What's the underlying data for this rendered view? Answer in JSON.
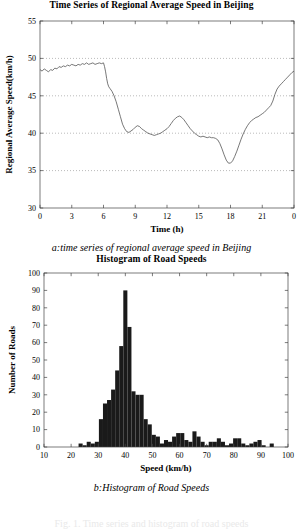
{
  "figure": {
    "panel_a": {
      "title": "Time Series of Regional Average Speed in Beijing",
      "caption": "a:time series of regional average speed in Beijing"
    },
    "panel_b": {
      "title": "Histogram of Road Speeds",
      "caption": "b:Histogram of Road Speeds"
    },
    "footer_partial": "Fig. 1.  Time series and histogram of road speeds"
  },
  "chart_data": [
    {
      "type": "line",
      "title": "Time Series of Regional Average Speed in Beijing",
      "xlabel": "Time (h)",
      "ylabel": "Regional Average Speed(km/h)",
      "xlim": [
        0,
        24
      ],
      "ylim": [
        30,
        55
      ],
      "xticks": [
        0,
        3,
        6,
        9,
        12,
        15,
        18,
        21,
        24
      ],
      "xticklabels": [
        "0",
        "3",
        "6",
        "9",
        "12",
        "15",
        "18",
        "21",
        "0"
      ],
      "yticks": [
        30,
        35,
        40,
        45,
        50,
        55
      ],
      "yticklabels": [
        "30",
        "35",
        "40",
        "45",
        "50",
        "55"
      ],
      "grid": "horizontal-dotted",
      "line_color": "#555555",
      "series": [
        {
          "name": "Regional Average Speed",
          "x": [
            0,
            0.2,
            0.4,
            0.6,
            0.8,
            1.0,
            1.2,
            1.4,
            1.6,
            1.8,
            2.0,
            2.2,
            2.4,
            2.6,
            2.8,
            3.0,
            3.2,
            3.4,
            3.6,
            3.8,
            4.0,
            4.2,
            4.4,
            4.6,
            4.8,
            5.0,
            5.2,
            5.4,
            5.6,
            5.8,
            6.0,
            6.1,
            6.2,
            6.3,
            6.4,
            6.5,
            6.6,
            6.8,
            7.0,
            7.2,
            7.4,
            7.6,
            7.8,
            8.0,
            8.2,
            8.4,
            8.6,
            8.8,
            9.0,
            9.2,
            9.4,
            9.6,
            9.8,
            10.0,
            10.2,
            10.4,
            10.6,
            10.8,
            11.0,
            11.2,
            11.4,
            11.6,
            11.8,
            12.0,
            12.2,
            12.4,
            12.6,
            12.8,
            13.0,
            13.2,
            13.4,
            13.6,
            13.8,
            14.0,
            14.2,
            14.4,
            14.6,
            14.8,
            15.0,
            15.2,
            15.4,
            15.6,
            15.8,
            16.0,
            16.2,
            16.4,
            16.6,
            16.8,
            17.0,
            17.2,
            17.4,
            17.6,
            17.8,
            18.0,
            18.2,
            18.4,
            18.6,
            18.8,
            19.0,
            19.2,
            19.4,
            19.6,
            19.8,
            20.0,
            20.2,
            20.4,
            20.6,
            20.8,
            21.0,
            21.2,
            21.4,
            21.6,
            21.8,
            22.0,
            22.2,
            22.4,
            22.6,
            22.8,
            23.0,
            23.2,
            23.4,
            23.6,
            23.8,
            24.0
          ],
          "y": [
            48.5,
            48.3,
            48.6,
            48.4,
            48.2,
            48.5,
            48.4,
            48.7,
            48.6,
            48.9,
            48.8,
            49.0,
            48.9,
            49.1,
            49.0,
            49.2,
            49.1,
            49.0,
            49.2,
            49.1,
            49.3,
            49.2,
            49.4,
            49.2,
            49.3,
            49.4,
            49.2,
            49.3,
            49.4,
            49.3,
            49.4,
            48.9,
            48.2,
            47.3,
            46.6,
            46.2,
            46.0,
            45.6,
            45.0,
            44.2,
            43.2,
            42.2,
            41.2,
            40.6,
            40.2,
            40.1,
            40.3,
            40.5,
            40.8,
            41.0,
            40.9,
            40.6,
            40.4,
            40.2,
            40.0,
            39.9,
            39.8,
            39.7,
            39.8,
            39.9,
            40.0,
            40.2,
            40.4,
            40.6,
            40.9,
            41.3,
            41.7,
            42.0,
            42.2,
            42.3,
            42.1,
            41.8,
            41.4,
            41.0,
            40.6,
            40.3,
            40.0,
            39.8,
            39.6,
            39.5,
            39.6,
            39.5,
            39.4,
            39.5,
            39.4,
            39.4,
            39.3,
            39.1,
            38.6,
            37.9,
            37.1,
            36.4,
            36.0,
            36.0,
            36.3,
            36.9,
            37.6,
            38.4,
            39.2,
            39.9,
            40.5,
            41.0,
            41.4,
            41.7,
            41.9,
            42.1,
            42.2,
            42.4,
            42.6,
            42.8,
            43.1,
            43.4,
            43.7,
            44.3,
            45.2,
            45.9,
            46.3,
            46.6,
            46.9,
            47.2,
            47.5,
            47.8,
            48.1,
            48.3,
            48.4
          ]
        }
      ]
    },
    {
      "type": "bar",
      "title": "Histogram of Road Speeds",
      "xlabel": "Speed (km/h)",
      "ylabel": "Number of Roads",
      "xlim": [
        10,
        100
      ],
      "ylim": [
        0,
        100
      ],
      "xticks": [
        10,
        20,
        30,
        40,
        50,
        60,
        70,
        80,
        90,
        100
      ],
      "xticklabels": [
        "10",
        "20",
        "30",
        "40",
        "50",
        "60",
        "70",
        "80",
        "90",
        "100"
      ],
      "yticks": [
        0,
        10,
        20,
        30,
        40,
        50,
        60,
        70,
        80,
        90,
        100
      ],
      "yticklabels": [
        "0",
        "10",
        "20",
        "30",
        "40",
        "50",
        "60",
        "70",
        "80",
        "90",
        "100"
      ],
      "grid": "none",
      "bar_color": "#1a1a1a",
      "bin_width": 1.5,
      "bin_centers": [
        23.5,
        25.0,
        26.5,
        28.0,
        29.5,
        31.0,
        32.5,
        34.0,
        35.5,
        37.0,
        38.5,
        40.0,
        41.5,
        43.0,
        44.5,
        46.0,
        47.5,
        49.0,
        50.5,
        52.0,
        53.5,
        55.0,
        56.5,
        58.0,
        59.5,
        61.0,
        62.5,
        64.0,
        65.5,
        67.0,
        68.5,
        70.0,
        71.5,
        73.0,
        74.5,
        76.0,
        77.5,
        79.0,
        80.5,
        82.0,
        83.5,
        85.0,
        86.5,
        88.0,
        89.5,
        91.0,
        94.0
      ],
      "values": [
        2,
        1,
        3,
        2,
        3,
        16,
        25,
        27,
        33,
        44,
        58,
        90,
        69,
        32,
        30,
        30,
        16,
        13,
        7,
        6,
        2,
        4,
        3,
        6,
        8,
        8,
        4,
        3,
        9,
        6,
        3,
        1,
        3,
        3,
        5,
        3,
        1,
        2,
        5,
        5,
        2,
        1,
        2,
        3,
        4,
        1,
        2
      ]
    }
  ]
}
